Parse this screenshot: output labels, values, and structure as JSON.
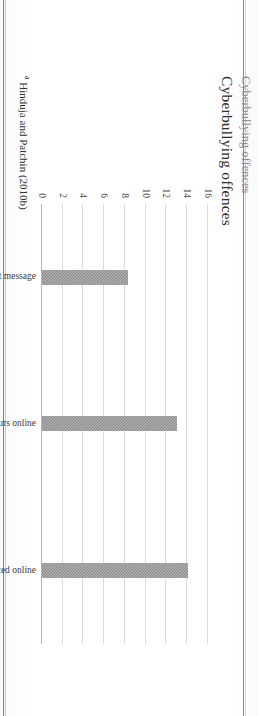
{
  "page": {
    "scan_rotation_degrees": 90,
    "background_color": "#ffffff",
    "border_color": "#6d6d6d"
  },
  "figure": {
    "title": "Cyberbullying offences",
    "supertitle_clipped": "Cyberbullying offences",
    "footnote_marker": "a",
    "footnote_text": "Hinduja and Patchin (2010b)"
  },
  "chart_data": {
    "type": "bar",
    "title": "Cyberbullying offences",
    "orientation": "vertical",
    "categories": [
      "threats via text message",
      "rumours online",
      "mean or hurtful comments posted online"
    ],
    "values": [
      8.3,
      13.0,
      14.1
    ],
    "xlabel": "",
    "ylabel": "",
    "ylim": [
      0,
      16
    ],
    "ytick_labels": [
      "0",
      "2",
      "4",
      "6",
      "8",
      "10",
      "12",
      "14",
      "16"
    ],
    "ytick_values": [
      0,
      2,
      4,
      6,
      8,
      10,
      12,
      14,
      16
    ],
    "grid": true,
    "grid_axis": "y",
    "legend": false,
    "bar_color": "#8f8f8f",
    "bar_pattern": "fine-checker-hatch",
    "gridline_color": "#dcdcdc",
    "axis_color": "#b4b4b4"
  }
}
